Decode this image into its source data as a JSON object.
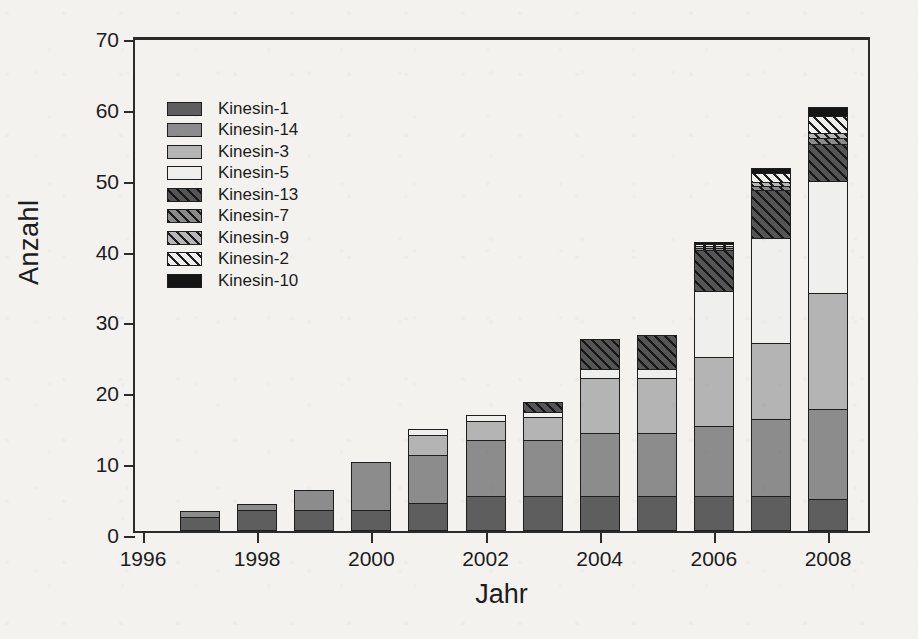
{
  "chart_data": {
    "type": "bar",
    "stacked": true,
    "title": "",
    "xlabel": "Jahr",
    "ylabel": "Anzahl",
    "ylim": [
      0,
      70
    ],
    "yticks": [
      0,
      10,
      20,
      30,
      40,
      50,
      60,
      70
    ],
    "xticks": [
      1996,
      1998,
      2000,
      2002,
      2004,
      2006,
      2008
    ],
    "categories": [
      1996,
      1997,
      1998,
      1999,
      2000,
      2001,
      2002,
      2003,
      2004,
      2005,
      2006,
      2007,
      2008
    ],
    "grid": false,
    "legend_position": "upper left",
    "series": [
      {
        "name": "Kinesin-1",
        "pattern": "solid",
        "color": "#5e5e5e",
        "values": [
          0,
          2,
          3,
          3,
          3,
          4,
          5,
          5,
          5,
          5,
          5,
          5,
          4.5
        ]
      },
      {
        "name": "Kinesin-14",
        "pattern": "solid",
        "color": "#8c8c8c",
        "values": [
          0,
          1,
          1,
          3,
          7,
          7,
          8,
          8,
          9,
          9,
          10,
          11,
          13
        ]
      },
      {
        "name": "Kinesin-3",
        "pattern": "solid",
        "color": "#b4b4b4",
        "values": [
          0,
          0,
          0,
          0,
          0,
          3,
          3,
          3.5,
          8,
          8,
          10,
          11,
          16.5
        ]
      },
      {
        "name": "Kinesin-5",
        "pattern": "solid",
        "color": "#efefee",
        "values": [
          0,
          0,
          0,
          0,
          0,
          1,
          1,
          1,
          1.5,
          1.5,
          9.5,
          15,
          16
        ]
      },
      {
        "name": "Kinesin-13",
        "pattern": "hatched",
        "color": "#555555",
        "values": [
          0,
          0,
          0,
          0,
          0,
          0,
          0,
          1.5,
          4.5,
          5,
          6,
          7,
          5.5
        ]
      },
      {
        "name": "Kinesin-7",
        "pattern": "hatched",
        "color": "#8a8a8a",
        "values": [
          0,
          0,
          0,
          0,
          0,
          0,
          0,
          0,
          0,
          0,
          0.5,
          0.8,
          1
        ]
      },
      {
        "name": "Kinesin-9",
        "pattern": "hatched",
        "color": "#b6b6b6",
        "values": [
          0,
          0,
          0,
          0,
          0,
          0,
          0,
          0,
          0,
          0,
          0.5,
          0.7,
          1
        ]
      },
      {
        "name": "Kinesin-2",
        "pattern": "hatched",
        "color": "#eeeeed",
        "values": [
          0,
          0,
          0,
          0,
          0,
          0,
          0,
          0,
          0,
          0,
          0.5,
          1.5,
          2.5
        ]
      },
      {
        "name": "Kinesin-10",
        "pattern": "solid",
        "color": "#151515",
        "values": [
          0,
          0,
          0,
          0,
          0,
          0,
          0,
          0,
          0,
          0,
          0.5,
          1,
          1.5
        ]
      }
    ],
    "totals": [
      0,
      3,
      4,
      6,
      10,
      15,
      17,
      19,
      28,
      28.5,
      42,
      52,
      60.5
    ]
  },
  "legend": {
    "items": [
      {
        "label": "Kinesin-1"
      },
      {
        "label": "Kinesin-14"
      },
      {
        "label": "Kinesin-3"
      },
      {
        "label": "Kinesin-5"
      },
      {
        "label": "Kinesin-13"
      },
      {
        "label": "Kinesin-7"
      },
      {
        "label": "Kinesin-9"
      },
      {
        "label": "Kinesin-2"
      },
      {
        "label": "Kinesin-10"
      }
    ]
  },
  "axes": {
    "y_label": "Anzahl",
    "x_label": "Jahr",
    "y_tick_labels": [
      "0",
      "10",
      "20",
      "30",
      "40",
      "50",
      "60",
      "70"
    ],
    "x_tick_labels": [
      "1996",
      "1998",
      "2000",
      "2002",
      "2004",
      "2006",
      "2008"
    ]
  },
  "colors": {
    "axis": "#2b2b2b",
    "text": "#1c1c1c",
    "background": "#f4f2ee"
  }
}
